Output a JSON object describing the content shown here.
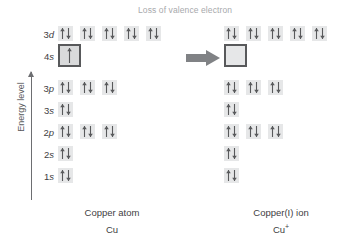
{
  "figure": {
    "title": "Loss of valence electron",
    "energy_axis_label": "Energy level",
    "background_color": "#ffffff",
    "text_color": "#414042",
    "title_color": "#a7a9ac",
    "orbital_fill_color": "#e6e7e8",
    "highlight_border_color": "#58595b",
    "arrow_color": "#808285"
  },
  "rows": [
    {
      "label_n": "3",
      "label_l": "d"
    },
    {
      "label_n": "4",
      "label_l": "s"
    },
    {
      "label_n": "3",
      "label_l": "p"
    },
    {
      "label_n": "3",
      "label_l": "s"
    },
    {
      "label_n": "2",
      "label_l": "p"
    },
    {
      "label_n": "2",
      "label_l": "s"
    },
    {
      "label_n": "1",
      "label_l": "s"
    }
  ],
  "species": [
    {
      "side": "left",
      "name": "Copper atom",
      "formula": "Cu",
      "charge": "",
      "config": [
        {
          "subshell": "3d",
          "orbitals": [
            "pair",
            "pair",
            "pair",
            "pair",
            "pair"
          ],
          "highlighted": false
        },
        {
          "subshell": "4s",
          "orbitals": [
            "single"
          ],
          "highlighted": true
        },
        {
          "subshell": "3p",
          "orbitals": [
            "pair",
            "pair",
            "pair"
          ],
          "highlighted": false
        },
        {
          "subshell": "3s",
          "orbitals": [
            "pair"
          ],
          "highlighted": false
        },
        {
          "subshell": "2p",
          "orbitals": [
            "pair",
            "pair",
            "pair"
          ],
          "highlighted": false
        },
        {
          "subshell": "2s",
          "orbitals": [
            "pair"
          ],
          "highlighted": false
        },
        {
          "subshell": "1s",
          "orbitals": [
            "pair"
          ],
          "highlighted": false
        }
      ]
    },
    {
      "side": "right",
      "name": "Copper(I) ion",
      "formula": "Cu",
      "charge": "+",
      "config": [
        {
          "subshell": "3d",
          "orbitals": [
            "pair",
            "pair",
            "pair",
            "pair",
            "pair"
          ],
          "highlighted": false
        },
        {
          "subshell": "4s",
          "orbitals": [
            "empty"
          ],
          "highlighted": true
        },
        {
          "subshell": "3p",
          "orbitals": [
            "pair",
            "pair",
            "pair"
          ],
          "highlighted": false
        },
        {
          "subshell": "3s",
          "orbitals": [
            "pair"
          ],
          "highlighted": false
        },
        {
          "subshell": "2p",
          "orbitals": [
            "pair",
            "pair",
            "pair"
          ],
          "highlighted": false
        },
        {
          "subshell": "2s",
          "orbitals": [
            "pair"
          ],
          "highlighted": false
        },
        {
          "subshell": "1s",
          "orbitals": [
            "pair"
          ],
          "highlighted": false
        }
      ]
    }
  ],
  "row_tops": [
    26,
    48,
    80,
    102,
    124,
    146,
    168
  ],
  "transition": {
    "icon": "right-arrow-icon"
  }
}
